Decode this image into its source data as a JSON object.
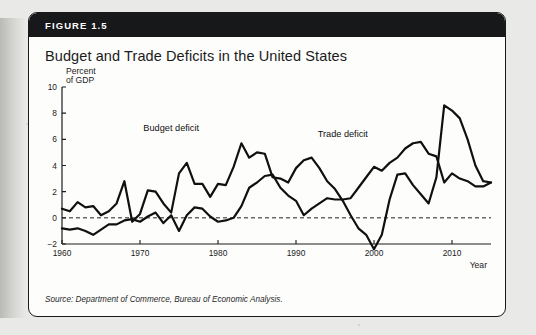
{
  "figure": {
    "number_label": "FIGURE 1.5",
    "title": "Budget and Trade Deficits in the United States",
    "source": "Source: Department of Commerce, Bureau of Economic Analysis."
  },
  "chart_data": {
    "type": "line",
    "title": "Budget and Trade Deficits in the United States",
    "xlabel": "Year",
    "ylabel": "Percent of GDP",
    "ylabel_line1": "Percent",
    "ylabel_line2": "of GDP",
    "xlim": [
      1960,
      2015
    ],
    "ylim": [
      -2,
      10
    ],
    "yticks": [
      -2,
      0,
      2,
      4,
      6,
      8,
      10
    ],
    "ytick_labels": [
      "−2",
      "0",
      "2",
      "4",
      "6",
      "8",
      "10"
    ],
    "xticks": [
      1960,
      1970,
      1980,
      1990,
      2000,
      2010
    ],
    "xtick_labels": [
      "1960",
      "1970",
      "1980",
      "1990",
      "2000",
      "2010"
    ],
    "grid": false,
    "zero_reference_line": true,
    "legend_position": "inline-annotations",
    "annotations": [
      {
        "text": "Budget deficit",
        "x": 1974,
        "y": 6.6
      },
      {
        "text": "Trade deficit",
        "x": 1996,
        "y": 6.2
      }
    ],
    "x": [
      1960,
      1961,
      1962,
      1963,
      1964,
      1965,
      1966,
      1967,
      1968,
      1969,
      1970,
      1971,
      1972,
      1973,
      1974,
      1975,
      1976,
      1977,
      1978,
      1979,
      1980,
      1981,
      1982,
      1983,
      1984,
      1985,
      1986,
      1987,
      1988,
      1989,
      1990,
      1991,
      1992,
      1993,
      1994,
      1995,
      1996,
      1997,
      1998,
      1999,
      2000,
      2001,
      2002,
      2003,
      2004,
      2005,
      2006,
      2007,
      2008,
      2009,
      2010,
      2011,
      2012,
      2013,
      2014,
      2015
    ],
    "series": [
      {
        "name": "Budget deficit",
        "values": [
          0.7,
          0.5,
          1.2,
          0.8,
          0.9,
          0.2,
          0.5,
          1.1,
          2.8,
          -0.3,
          0.3,
          2.1,
          2.0,
          1.1,
          0.4,
          3.4,
          4.2,
          2.6,
          2.6,
          1.6,
          2.6,
          2.5,
          3.9,
          5.7,
          4.6,
          5.0,
          4.9,
          3.1,
          3.0,
          2.7,
          3.8,
          4.4,
          4.6,
          3.8,
          2.8,
          2.2,
          1.3,
          0.2,
          -0.8,
          -1.3,
          -2.4,
          -1.3,
          1.4,
          3.3,
          3.4,
          2.5,
          1.8,
          1.1,
          3.1,
          8.6,
          8.2,
          7.6,
          6.0,
          4.0,
          2.8,
          2.7
        ]
      },
      {
        "name": "Trade deficit",
        "values": [
          -0.8,
          -0.9,
          -0.8,
          -1.0,
          -1.3,
          -0.9,
          -0.5,
          -0.5,
          -0.2,
          -0.1,
          -0.3,
          0.1,
          0.4,
          -0.4,
          0.2,
          -1.0,
          0.2,
          0.8,
          0.7,
          0.1,
          -0.3,
          -0.2,
          0.0,
          0.9,
          2.3,
          2.7,
          3.2,
          3.3,
          2.3,
          1.7,
          1.3,
          0.2,
          0.7,
          1.1,
          1.5,
          1.4,
          1.4,
          1.5,
          2.3,
          3.1,
          3.9,
          3.6,
          4.2,
          4.6,
          5.3,
          5.7,
          5.8,
          4.9,
          4.7,
          2.7,
          3.4,
          3.0,
          2.8,
          2.4,
          2.4,
          2.7
        ]
      }
    ]
  }
}
